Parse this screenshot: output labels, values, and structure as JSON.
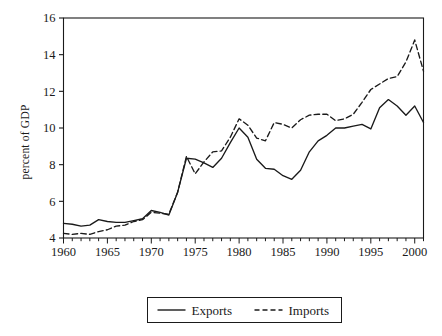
{
  "chart_data": {
    "type": "line",
    "title": "",
    "xlabel": "",
    "ylabel": "percent of GDP",
    "xlim": [
      1960,
      2001
    ],
    "ylim": [
      4,
      16
    ],
    "xticks": [
      1960,
      1965,
      1970,
      1975,
      1980,
      1985,
      1990,
      1995,
      2000
    ],
    "xtick_labels": [
      "1960",
      "1965",
      "1970",
      "1975",
      "1980",
      "1985",
      "1990",
      "1995",
      "2000"
    ],
    "yticks": [
      4,
      6,
      8,
      10,
      12,
      14,
      16
    ],
    "ytick_labels": [
      "4",
      "6",
      "8",
      "10",
      "12",
      "14",
      "16"
    ],
    "grid": false,
    "minor_xticks_every": 1,
    "legend_position": "below-center",
    "x": [
      1960,
      1961,
      1962,
      1963,
      1964,
      1965,
      1966,
      1967,
      1968,
      1969,
      1970,
      1971,
      1972,
      1973,
      1974,
      1975,
      1976,
      1977,
      1978,
      1979,
      1980,
      1981,
      1982,
      1983,
      1984,
      1985,
      1986,
      1987,
      1988,
      1989,
      1990,
      1991,
      1992,
      1993,
      1994,
      1995,
      1996,
      1997,
      1998,
      1999,
      2000,
      2001
    ],
    "series": [
      {
        "name": "Exports",
        "style": "solid",
        "color": "#1a1a1a",
        "values": [
          4.8,
          4.75,
          4.65,
          4.7,
          5.0,
          4.9,
          4.85,
          4.85,
          4.95,
          5.05,
          5.5,
          5.4,
          5.25,
          6.5,
          8.35,
          8.3,
          8.1,
          7.85,
          8.35,
          9.2,
          10.0,
          9.5,
          8.3,
          7.8,
          7.75,
          7.4,
          7.2,
          7.7,
          8.7,
          9.3,
          9.6,
          10.0,
          10.0,
          10.1,
          10.2,
          9.95,
          11.1,
          11.55,
          11.2,
          10.7,
          11.2,
          10.3
        ]
      },
      {
        "name": "Imports",
        "style": "dashed",
        "color": "#1a1a1a",
        "values": [
          4.25,
          4.2,
          4.25,
          4.2,
          4.35,
          4.45,
          4.65,
          4.7,
          4.9,
          5.0,
          5.4,
          5.35,
          5.3,
          6.5,
          8.45,
          7.5,
          8.15,
          8.7,
          8.75,
          9.5,
          10.5,
          10.15,
          9.45,
          9.3,
          10.3,
          10.2,
          10.0,
          10.45,
          10.7,
          10.75,
          10.75,
          10.4,
          10.5,
          10.75,
          11.4,
          12.1,
          12.4,
          12.7,
          12.8,
          13.6,
          14.8,
          13.1
        ]
      }
    ]
  },
  "legend": {
    "entries": [
      {
        "label": "Exports",
        "style": "solid"
      },
      {
        "label": "Imports",
        "style": "dashed"
      }
    ]
  },
  "axis": {
    "ylabel": "percent of GDP"
  }
}
